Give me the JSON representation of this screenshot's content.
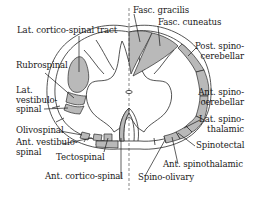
{
  "diagram": {
    "colors": {
      "tract_fill": "#b9b9b9",
      "outline": "#2a2a2a",
      "background": "#ffffff",
      "text": "#1a1a1a"
    },
    "labels": {
      "lat_cortico_spinal": "Lat. cortico-spinal tract",
      "rubrospinal": "Rubrospinal",
      "lat_vestibulo_spinal": "Lat.\nvestibulo-\nspinal",
      "olivospinal": "Olivospinal",
      "ant_vestibulo_spinal": "Ant. vestibulo-\nspinal",
      "tectospinal": "Tectospinal",
      "ant_cortico_spinal": "Ant. cortico-spinal",
      "fasc_gracilis": "Fasc. gracilis",
      "fasc_cuneatus": "Fasc. cuneatus",
      "post_spino_cerebellar": "Post. spino-\ncerebellar",
      "ant_spino_cerebellar": "Ant. spino-\ncerebellar",
      "lat_spino_thalamic": "Lat. spino-\nthalamic",
      "spinotectal": "Spinotectal",
      "ant_spinothalamic": "Ant. spinothalamic",
      "spino_olivary": "Spino-olivary"
    },
    "left_side": [
      "Lat. cortico-spinal tract",
      "Rubrospinal",
      "Lat. vestibulo-spinal",
      "Olivospinal",
      "Ant. vestibulo-spinal",
      "Tectospinal",
      "Ant. cortico-spinal"
    ],
    "right_side": [
      "Fasc. gracilis",
      "Fasc. cuneatus",
      "Post. spino-cerebellar",
      "Ant. spino-cerebellar",
      "Lat. spino-thalamic",
      "Spinotectal",
      "Ant. spinothalamic",
      "Spino-olivary"
    ]
  }
}
